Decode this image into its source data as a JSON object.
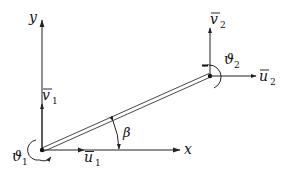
{
  "diagram": {
    "type": "beam-element-dof",
    "axes": {
      "x_label": "x",
      "y_label": "y"
    },
    "angle_label": "β",
    "node1": {
      "u_label": "u",
      "u_sub": "1",
      "v_label": "v",
      "v_sub": "1",
      "theta_label": "ϑ",
      "theta_sub": "1"
    },
    "node2": {
      "u_label": "u",
      "u_sub": "2",
      "v_label": "v",
      "v_sub": "2",
      "theta_label": "ϑ",
      "theta_sub": "2"
    },
    "colors": {
      "ink": "#222222",
      "background": "#ffffff"
    }
  }
}
